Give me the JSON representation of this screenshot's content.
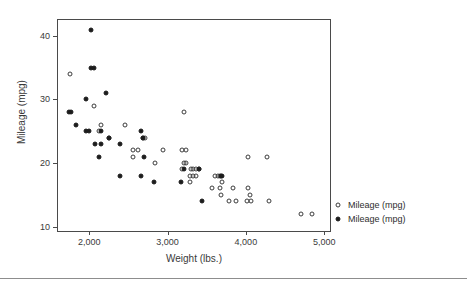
{
  "chart_data": {
    "type": "scatter",
    "title": "",
    "xlabel": "Weight (lbs.)",
    "ylabel": "Mileage (mpg)",
    "xlim": [
      1600,
      5100
    ],
    "ylim": [
      9,
      42.5
    ],
    "xticks": [
      2000,
      3000,
      4000,
      5000
    ],
    "xtick_labels": [
      "2,000",
      "3,000",
      "4,000",
      "5,000"
    ],
    "yticks": [
      10,
      20,
      30,
      40
    ],
    "ytick_labels": [
      "10",
      "20",
      "30",
      "40"
    ],
    "grid": false,
    "legend_position": "right",
    "series": [
      {
        "name": "Mileage (mpg)",
        "marker": "open-circle",
        "color": "#3c3c3c",
        "points": [
          [
            1755,
            34
          ],
          [
            2065,
            29
          ],
          [
            2145,
            26
          ],
          [
            2120,
            25
          ],
          [
            2250,
            24
          ],
          [
            2455,
            26
          ],
          [
            2560,
            22
          ],
          [
            2620,
            22
          ],
          [
            2560,
            21
          ],
          [
            2680,
            24
          ],
          [
            2715,
            24
          ],
          [
            2835,
            20
          ],
          [
            2940,
            22
          ],
          [
            3190,
            22
          ],
          [
            3240,
            22
          ],
          [
            3210,
            28
          ],
          [
            3210,
            20
          ],
          [
            3235,
            20
          ],
          [
            3190,
            19
          ],
          [
            3300,
            19
          ],
          [
            3330,
            19
          ],
          [
            3360,
            19
          ],
          [
            3395,
            19
          ],
          [
            3290,
            18
          ],
          [
            3325,
            18
          ],
          [
            3360,
            18
          ],
          [
            3290,
            17
          ],
          [
            3600,
            18
          ],
          [
            3640,
            18
          ],
          [
            3665,
            18
          ],
          [
            3700,
            17
          ],
          [
            3565,
            16
          ],
          [
            3670,
            16
          ],
          [
            3680,
            15
          ],
          [
            3830,
            16
          ],
          [
            4025,
            16
          ],
          [
            4050,
            15
          ],
          [
            4025,
            21
          ],
          [
            4275,
            21
          ],
          [
            3790,
            14
          ],
          [
            3870,
            14
          ],
          [
            4020,
            14
          ],
          [
            4070,
            14
          ],
          [
            4290,
            14
          ],
          [
            4705,
            12
          ],
          [
            4840,
            12
          ]
        ]
      },
      {
        "name": "Mileage (mpg)",
        "marker": "filled-circle",
        "color": "#1c1c1c",
        "points": [
          [
            2025,
            41
          ],
          [
            2025,
            35
          ],
          [
            2065,
            35
          ],
          [
            2210,
            31
          ],
          [
            1955,
            30
          ],
          [
            1740,
            28
          ],
          [
            1760,
            28
          ],
          [
            1835,
            26
          ],
          [
            1955,
            25
          ],
          [
            1995,
            25
          ],
          [
            2150,
            25
          ],
          [
            2075,
            23
          ],
          [
            2145,
            23
          ],
          [
            2390,
            23
          ],
          [
            2250,
            24
          ],
          [
            2655,
            25
          ],
          [
            2690,
            24
          ],
          [
            2120,
            21
          ],
          [
            2700,
            21
          ],
          [
            2395,
            18
          ],
          [
            2655,
            18
          ],
          [
            2830,
            17
          ],
          [
            3175,
            17
          ],
          [
            3215,
            19
          ],
          [
            3395,
            19
          ],
          [
            3680,
            18
          ],
          [
            3695,
            18
          ],
          [
            3440,
            14
          ]
        ]
      }
    ]
  },
  "axes": {
    "x_title": "Weight (lbs.)",
    "y_title": "Mileage (mpg)"
  },
  "legend": {
    "entries": [
      {
        "label": "Mileage (mpg)",
        "marker": "open-circle"
      },
      {
        "label": "Mileage (mpg)",
        "marker": "filled-circle"
      }
    ]
  }
}
